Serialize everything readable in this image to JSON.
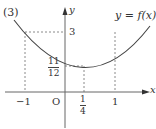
{
  "problem_label": "(3)",
  "curve_label": "y = f(x)",
  "axes": {
    "x_label": "x",
    "y_label": "y",
    "origin_label": "O"
  },
  "ticks": {
    "x_neg1": "−1",
    "x_quarter_num": "1",
    "x_quarter_den": "4",
    "x_one": "1",
    "y_three": "3",
    "y_min_num": "11",
    "y_min_den": "12"
  },
  "colors": {
    "axis": "#555555",
    "curve": "#444444",
    "dashed": "#888888",
    "text": "#333333"
  }
}
